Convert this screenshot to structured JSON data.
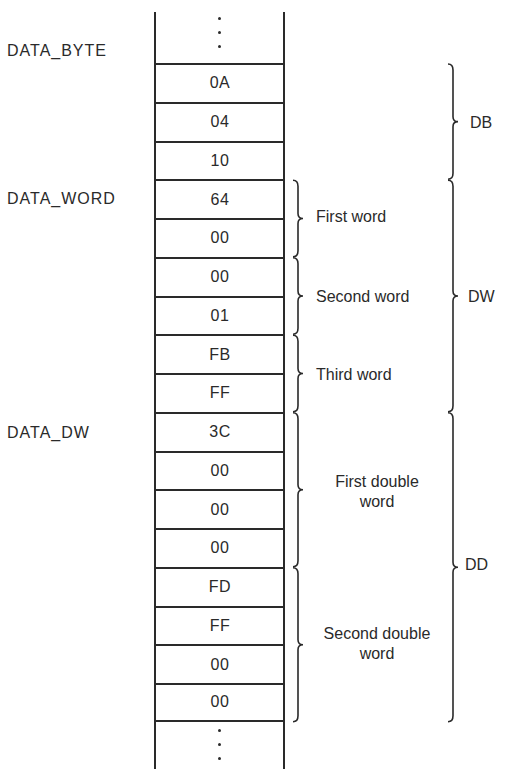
{
  "diagram": {
    "type": "memory-layout",
    "ellipsis": "⋮",
    "cells": [
      "0A",
      "04",
      "10",
      "64",
      "00",
      "00",
      "01",
      "FB",
      "FF",
      "3C",
      "00",
      "00",
      "00",
      "FD",
      "FF",
      "00",
      "00"
    ],
    "variable_labels": [
      {
        "text": "DATA_BYTE",
        "row": 0
      },
      {
        "text": "DATA_WORD",
        "row": 3
      },
      {
        "text": "DATA_DW",
        "row": 9
      }
    ],
    "inner_groups": [
      {
        "label": "First word",
        "start": 3,
        "end": 4
      },
      {
        "label": "Second word",
        "start": 5,
        "end": 6
      },
      {
        "label": "Third word",
        "start": 7,
        "end": 8
      },
      {
        "label": "First double word",
        "start": 9,
        "end": 12
      },
      {
        "label": "Second double word",
        "start": 13,
        "end": 16
      }
    ],
    "outer_groups": [
      {
        "label": "DB",
        "start": 0,
        "end": 2
      },
      {
        "label": "DW",
        "start": 3,
        "end": 8
      },
      {
        "label": "DD",
        "start": 9,
        "end": 16
      }
    ]
  },
  "labels": {
    "data_byte": "DATA_BYTE",
    "data_word": "DATA_WORD",
    "data_dw": "DATA_DW",
    "first_word": "First word",
    "second_word": "Second word",
    "third_word": "Third word",
    "first_dw_1": "First double",
    "first_dw_2": "word",
    "second_dw_1": "Second double",
    "second_dw_2": "word",
    "db": "DB",
    "dw": "DW",
    "dd": "DD"
  }
}
